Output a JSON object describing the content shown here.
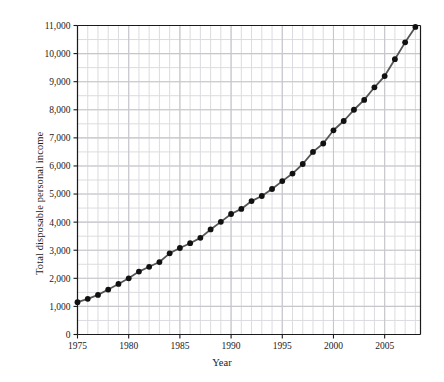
{
  "chart_data": {
    "type": "line",
    "title": "",
    "xlabel": "Year",
    "ylabel": "Total disposable personal income",
    "xlim": [
      1975,
      2008.5
    ],
    "ylim": [
      0,
      11000
    ],
    "grid": true,
    "legend": null,
    "x_ticks": [
      1975,
      1980,
      1985,
      1990,
      1995,
      2000,
      2005
    ],
    "x_tick_labels": [
      "1975",
      "1980",
      "1985",
      "1990",
      "1995",
      "2000",
      "2005"
    ],
    "x_minor_step": 1,
    "y_ticks": [
      0,
      1000,
      2000,
      3000,
      4000,
      5000,
      6000,
      7000,
      8000,
      9000,
      10000,
      11000
    ],
    "y_tick_labels": [
      "0",
      "1,000",
      "2,000",
      "3,000",
      "4,000",
      "5,000",
      "6,000",
      "7,000",
      "8,000",
      "9,000",
      "10,000",
      "11,000"
    ],
    "y_minor_step": 500,
    "series": [
      {
        "name": "Total disposable personal income",
        "marker": "filled-circle",
        "line_color": "#555555",
        "marker_color": "#111111",
        "x": [
          1975,
          1976,
          1977,
          1978,
          1979,
          1980,
          1981,
          1982,
          1983,
          1984,
          1985,
          1986,
          1987,
          1988,
          1989,
          1990,
          1991,
          1992,
          1993,
          1994,
          1995,
          1996,
          1997,
          1998,
          1999,
          2000,
          2001,
          2002,
          2003,
          2004,
          2005,
          2006,
          2007,
          2008
        ],
        "values": [
          1150,
          1270,
          1410,
          1600,
          1800,
          2000,
          2240,
          2410,
          2580,
          2890,
          3080,
          3250,
          3440,
          3740,
          4010,
          4290,
          4470,
          4750,
          4930,
          5180,
          5460,
          5730,
          6070,
          6500,
          6800,
          7270,
          7600,
          8000,
          8350,
          8800,
          9200,
          9800,
          10400,
          10950
        ]
      }
    ]
  },
  "figure": {
    "background": "#ffffff",
    "grid_color": "#dcdce0",
    "grid_major_color": "#c6c6cc",
    "axis_color": "#1a1a1a"
  }
}
